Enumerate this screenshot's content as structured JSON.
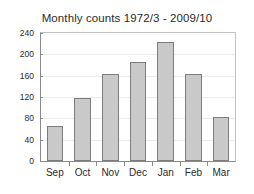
{
  "chart_data": {
    "type": "bar",
    "title": "Monthly counts 1972/3 - 2009/10",
    "xlabel": "",
    "ylabel": "",
    "categories": [
      "Sep",
      "Oct",
      "Nov",
      "Dec",
      "Jan",
      "Feb",
      "Mar"
    ],
    "values": [
      65,
      118,
      164,
      185,
      223,
      164,
      83
    ],
    "ylim": [
      0,
      240
    ],
    "yticks": [
      0,
      40,
      80,
      120,
      160,
      200,
      240
    ],
    "ytick_labels": [
      "0",
      "40",
      "80",
      "120",
      "160",
      "200",
      "240"
    ],
    "grid": true,
    "grid_axis": "y",
    "legend": false,
    "bar_fill_color": "#c9c9c9",
    "bar_edge_color": "#7d7d7d",
    "axis_color": "#8a8a8a",
    "grid_color": "#ededed",
    "background_color": "#ffffff",
    "text_color": "#2b2b2b"
  }
}
